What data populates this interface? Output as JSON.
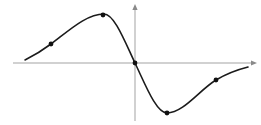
{
  "figure": {
    "kind": "function-plot",
    "background": "#ffffff"
  },
  "chart_data": {
    "type": "line",
    "title": "",
    "xlabel": "",
    "ylabel": "",
    "grid": false,
    "ticks": "none",
    "legend": "none",
    "canvas_px": {
      "width": 261,
      "height": 125
    },
    "origin_px": {
      "x": 135,
      "y": 63
    },
    "axes": {
      "color": "#a3a3a3",
      "arrow_color": "#8a8a8a",
      "x_axis": {
        "x1": 13,
        "y1": 63,
        "x2": 252,
        "y2": 63,
        "arrow": "right"
      },
      "y_axis": {
        "x1": 135,
        "y1": 121,
        "x2": 135,
        "y2": 9,
        "arrow": "up"
      },
      "x_arrow_tip": {
        "x": 257,
        "y": 63
      },
      "y_arrow_tip": {
        "x": 135,
        "y": 4
      }
    },
    "curve": {
      "color": "#1b1b1b",
      "stroke_width": 1.6,
      "points": [
        {
          "x": 25,
          "y": 60,
          "m": -0.5
        },
        {
          "x": 51,
          "y": 44,
          "m": -0.75
        },
        {
          "x": 104,
          "y": 14,
          "m": 0
        },
        {
          "x": 135,
          "y": 63,
          "m": 2.1
        },
        {
          "x": 167,
          "y": 113,
          "m": 0
        },
        {
          "x": 216,
          "y": 80,
          "m": -0.6
        },
        {
          "x": 248,
          "y": 67,
          "m": -0.25
        }
      ]
    },
    "marked_points": {
      "color": "#111111",
      "radius": 2.4,
      "points": [
        {
          "x": 51,
          "y": 44
        },
        {
          "x": 103,
          "y": 15
        },
        {
          "x": 135,
          "y": 63
        },
        {
          "x": 167,
          "y": 113
        },
        {
          "x": 216,
          "y": 80
        }
      ]
    }
  }
}
